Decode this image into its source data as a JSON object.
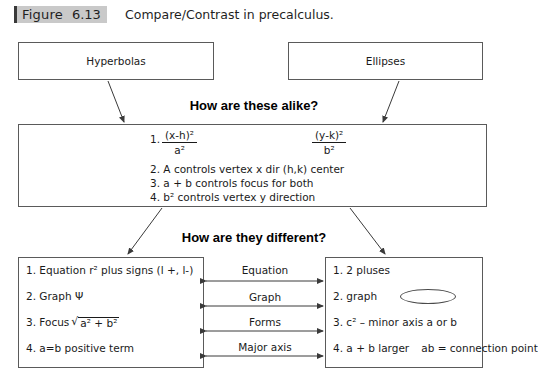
{
  "figure": {
    "label_word": "Figure",
    "number": "6.13",
    "caption": "Compare/Contrast in precalculus."
  },
  "top_boxes": {
    "left_label": "Hyperbolas",
    "right_label": "Ellipses"
  },
  "alike_section": {
    "heading": "How are these alike?",
    "equation": {
      "index": "1.",
      "left_numerator": "(x-h)²",
      "left_denominator": "a²",
      "right_numerator": "(y-k)²",
      "right_denominator": "b²"
    },
    "items": [
      "2. A controls vertex x dir (h,k) center",
      "3. a + b controls focus for both",
      "4. b² controls vertex y direction"
    ]
  },
  "different_section": {
    "heading": "How are they different?",
    "left_items": [
      "1. Equation r² plus signs (l +, l-)",
      "2. Graph Ψ",
      "3. Focus √a² + b²",
      "4. a=b positive term"
    ],
    "left_item_3": {
      "prefix": "3. Focus",
      "radicand": "a² + b²"
    },
    "right_items": [
      "1. 2 pluses",
      "2. graph",
      "3. c² – minor axis a or b"
    ],
    "right_item_4": {
      "line1": "4. a + b larger",
      "line2": "ab = connection point"
    },
    "connector_labels": [
      "Equation",
      "Graph",
      "Forms",
      "Major axis"
    ]
  },
  "colors": {
    "box_border": "#5a5a5a",
    "tag_background": "#c9c9c9",
    "tag_bar": "#3a3a3a",
    "text": "#1a1a1a",
    "arrow": "#3a3a3a"
  }
}
